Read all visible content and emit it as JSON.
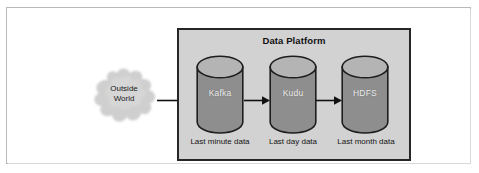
{
  "figure": {
    "title": "Data Platform",
    "outside_source": {
      "line1": "Outside",
      "line2": "World"
    },
    "stages": [
      {
        "name": "Kafka",
        "caption": "Last minute data"
      },
      {
        "name": "Kudu",
        "caption": "Last day data"
      },
      {
        "name": "HDFS",
        "caption": "Last month data"
      }
    ],
    "colors": {
      "platform_fill": "#d2d2d2",
      "platform_border": "#262626",
      "cylinder_body": "#8e8e8e",
      "cylinder_top": "#b4b4b4",
      "cylinder_stroke": "#1e1e1e",
      "cloud_fill": "#cfcfcf",
      "arrow": "#111111",
      "page_background": "#ffffff",
      "frame_border": "#b9b9b9"
    },
    "icons": {
      "cloud": "cloud-icon",
      "cylinder": "database-cylinder-icon",
      "arrow": "arrow-right-icon"
    }
  }
}
